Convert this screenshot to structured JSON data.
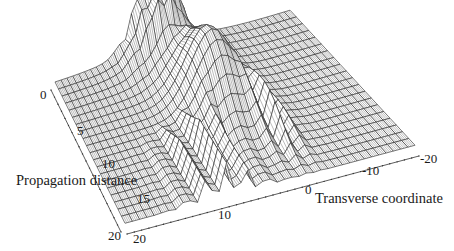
{
  "chart_data": {
    "type": "surface3d",
    "title": "",
    "style": "wireframe hidden-line, grayscale",
    "axes": {
      "x": {
        "label": "Transverse coordinate",
        "range": [
          20,
          -20
        ],
        "ticks": [
          20,
          10,
          0,
          -10,
          -20
        ]
      },
      "y": {
        "label": "Propagation distance",
        "range": [
          0,
          20
        ],
        "ticks": [
          0,
          5,
          10,
          15,
          20
        ]
      },
      "z": {
        "label": "",
        "range": [
          0,
          1
        ],
        "ticks": []
      }
    },
    "grid": {
      "transverse_samples": 41,
      "propagation_samples": 21
    },
    "features": [
      {
        "name": "initial-noisy-peaks",
        "propagation": [
          0,
          4
        ],
        "transverse": [
          -2,
          8
        ],
        "peak_height": 0.9
      },
      {
        "name": "main-lobe",
        "propagation": [
          4,
          14
        ],
        "transverse_center": 0,
        "width": 6,
        "peak_height": 0.75
      },
      {
        "name": "interference-ripples",
        "propagation": [
          12,
          20
        ],
        "transverse": [
          2,
          12
        ],
        "amplitude": 0.35
      },
      {
        "name": "side-lobes",
        "propagation": [
          10,
          18
        ],
        "transverse": [
          -8,
          -3
        ],
        "amplitude": 0.3
      }
    ],
    "background_level": 0.05
  },
  "labels": {
    "y_title": "Propagation distance",
    "x_title": "Transverse coordinate",
    "y_ticks": [
      "0",
      "5",
      "10",
      "15",
      "20"
    ],
    "x_ticks": [
      "20",
      "10",
      "0",
      "-10",
      "-20"
    ]
  },
  "colors": {
    "line": "#1e1e1e",
    "fill": "#ffffff",
    "axis": "#333333"
  }
}
